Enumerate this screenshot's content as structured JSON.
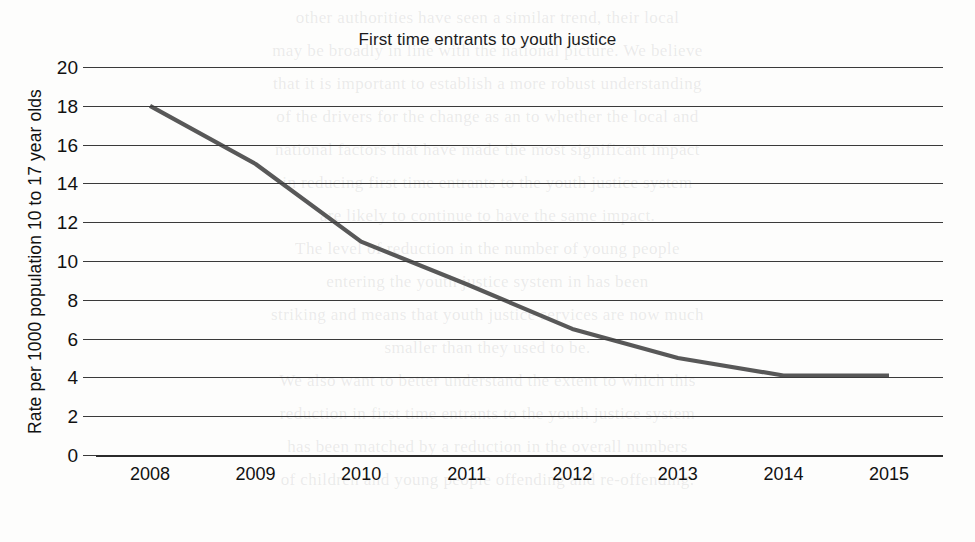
{
  "page": {
    "background_color": "#fdfdfc",
    "width": 975,
    "height": 542
  },
  "ghost_text": {
    "description": "faint show-through text from the reverse of the scanned page",
    "lines": [
      "other authorities have seen a similar trend, their local",
      "may be broadly in line with the national picture. We believe",
      "that it is important to establish a more robust understanding",
      "of the drivers for the change as an to whether the local and",
      "national factors that have made the most significant impact",
      "in reducing first time entrants to the youth justice system",
      "are likely to continue to have the same impact.",
      "The level of reduction in the number of young people",
      "entering the youth justice system in  has been",
      "striking and means that youth justice services are now much",
      "smaller than they used to be.",
      "We also want to better understand the extent to which this",
      "reduction in first time entrants to the youth justice system",
      "has been matched by a reduction in the overall numbers",
      "of children and young people offending and re-offending."
    ]
  },
  "chart_data": {
    "type": "line",
    "title": "First time entrants to youth justice",
    "xlabel": "",
    "ylabel": "Rate per 1000 population 10 to 17 year olds",
    "x": [
      "2008",
      "2009",
      "2010",
      "2011",
      "2012",
      "2013",
      "2014",
      "2015"
    ],
    "values": [
      18.0,
      15.0,
      11.0,
      8.8,
      6.5,
      5.0,
      4.1,
      4.1
    ],
    "series": [
      {
        "name": "First time entrants rate",
        "values": [
          18.0,
          15.0,
          11.0,
          8.8,
          6.5,
          5.0,
          4.1,
          4.1
        ],
        "color": "#585858"
      }
    ],
    "ylim": [
      0,
      20
    ],
    "y_ticks": [
      0,
      2,
      4,
      6,
      8,
      10,
      12,
      14,
      16,
      18,
      20
    ],
    "y_tick_labels": [
      "0",
      "2",
      "4",
      "6",
      "8",
      "10",
      "12",
      "14",
      "16",
      "18",
      "20"
    ],
    "x_tick_labels": [
      "2008",
      "2009",
      "2010",
      "2011",
      "2012",
      "2013",
      "2014",
      "2015"
    ],
    "grid": "horizontal",
    "legend": "none",
    "line_color": "#585858",
    "gridline_color": "#3a3a3a",
    "markers": "none"
  }
}
